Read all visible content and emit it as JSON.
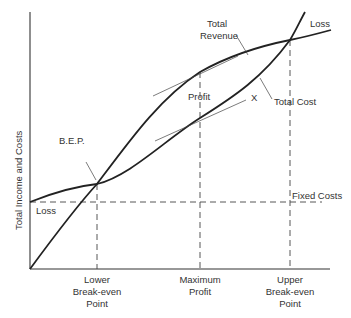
{
  "diagram": {
    "y_axis_label": "Total Income and Costs",
    "curves": {
      "total_revenue": "Total\nRevenue",
      "total_revenue_line1": "Total",
      "total_revenue_line2": "Revenue",
      "total_cost": "Total Cost"
    },
    "annotations": {
      "bep": "B.E.P.",
      "profit": "Profit",
      "x_marker": "X",
      "loss_left": "Loss",
      "loss_right": "Loss",
      "fixed_costs": "Fixed Costs"
    },
    "x_axis_labels": {
      "lower": [
        "Lower",
        "Break-even",
        "Point"
      ],
      "maximum": [
        "Maximum",
        "Profit"
      ],
      "upper": [
        "Upper",
        "Break-even",
        "Point"
      ]
    },
    "colors": {
      "line": "#222222",
      "text": "#333333",
      "background": "#ffffff"
    }
  }
}
